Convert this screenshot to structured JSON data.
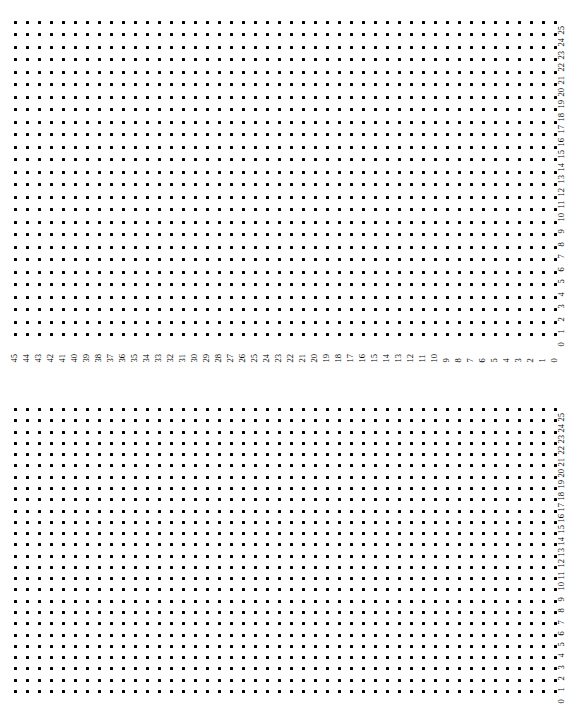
{
  "figure": {
    "panel_count": 2,
    "background_color": "#ffffff",
    "dot_color": "#000000"
  },
  "chart_data": [
    {
      "type": "scatter",
      "title": "",
      "subtitle": "",
      "xlabel": "",
      "ylabel": "",
      "grid": false,
      "legend": null,
      "annotations": [],
      "orientation": "rotated-labels",
      "x_axis": {
        "position": "bottom",
        "tick_rotation": 90,
        "direction": "descending",
        "xlim": [
          45,
          0
        ],
        "tick_labels": [
          "45",
          "44",
          "43",
          "42",
          "41",
          "40",
          "39",
          "38",
          "37",
          "36",
          "35",
          "34",
          "33",
          "32",
          "31",
          "30",
          "29",
          "28",
          "27",
          "26",
          "25",
          "24",
          "23",
          "22",
          "21",
          "20",
          "19",
          "18",
          "17",
          "16",
          "15",
          "14",
          "13",
          "12",
          "11",
          "10",
          "9",
          "8",
          "7",
          "6",
          "5",
          "4",
          "3",
          "2",
          "1",
          "0"
        ]
      },
      "y_axis": {
        "position": "right",
        "tick_rotation": 90,
        "direction": "descending",
        "ylim": [
          25,
          0
        ],
        "tick_labels": [
          "25",
          "24",
          "23",
          "22",
          "21",
          "20",
          "19",
          "18",
          "17",
          "16",
          "15",
          "14",
          "13",
          "12",
          "11",
          "10",
          "9",
          "8",
          "7",
          "6",
          "5",
          "4",
          "3",
          "2",
          "1",
          "0"
        ]
      },
      "columns": 46,
      "rows": 26,
      "point_count": 1196,
      "marker": "square",
      "marker_size_px": 3,
      "description": "Full regular lattice: one point at every integer (x,y) pair for x in 0..45 and y in 0..25"
    },
    {
      "type": "scatter",
      "title": "",
      "subtitle": "",
      "xlabel": "",
      "ylabel": "",
      "grid": false,
      "legend": null,
      "annotations": [],
      "orientation": "rotated-labels",
      "x_axis": {
        "position": "bottom",
        "tick_rotation": 90,
        "direction": "descending",
        "xlim": [
          45,
          0
        ],
        "tick_labels": [
          "45",
          "44",
          "43",
          "42",
          "41",
          "40",
          "39",
          "38",
          "37",
          "36",
          "35",
          "34",
          "33",
          "32",
          "31",
          "30",
          "29",
          "28",
          "27",
          "26",
          "25",
          "24",
          "23",
          "22",
          "21",
          "20",
          "19",
          "18",
          "17",
          "16",
          "15",
          "14",
          "13",
          "12",
          "11",
          "10",
          "9",
          "8",
          "7",
          "6",
          "5",
          "4",
          "3",
          "2",
          "1",
          "0"
        ]
      },
      "y_axis": {
        "position": "right",
        "tick_rotation": 90,
        "direction": "descending",
        "ylim": [
          25,
          0
        ],
        "tick_labels": [
          "25",
          "24",
          "23",
          "22",
          "21",
          "20",
          "19",
          "18",
          "17",
          "16",
          "15",
          "14",
          "13",
          "12",
          "11",
          "10",
          "9",
          "8",
          "7",
          "6",
          "5",
          "4",
          "3",
          "2",
          "1",
          "0"
        ]
      },
      "columns": 46,
      "rows": 26,
      "point_count": 1196,
      "marker": "square",
      "marker_size_px": 3,
      "description": "Full regular lattice: one point at every integer (x,y) pair for x in 0..45 and y in 0..25"
    }
  ],
  "layout": {
    "panels": [
      {
        "name": "top-panel",
        "dot_origin_x": 14,
        "dot_origin_y": 21,
        "col_pitch": 12.0,
        "row_pitch": 12.48,
        "x_axis_label_y": 340,
        "y_axis_label_x": 565,
        "y_axis_label_top": 21
      },
      {
        "name": "bottom-panel",
        "dot_origin_x": 14,
        "dot_origin_y": 21,
        "col_pitch": 12.0,
        "row_pitch": 11.28,
        "x_axis_label_y": 313,
        "y_axis_label_x": 565,
        "y_axis_label_top": 21
      }
    ]
  }
}
